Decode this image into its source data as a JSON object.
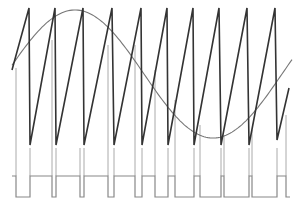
{
  "diagram": {
    "type": "pwm-modulation",
    "colors": {
      "background": "#ffffff",
      "sawtooth": "#333333",
      "sine": "#777777",
      "markers": "#aaaaaa",
      "pwm": "#888888"
    },
    "sawtooth": {
      "start": [
        12,
        70
      ],
      "peak_y": 8,
      "trough_y": 145,
      "teeth": [
        {
          "trough_x": 12,
          "peak_x": 29
        },
        {
          "trough_x": 30,
          "peak_x": 55
        },
        {
          "trough_x": 56,
          "peak_x": 83
        },
        {
          "trough_x": 84,
          "peak_x": 112
        },
        {
          "trough_x": 114,
          "peak_x": 141
        },
        {
          "trough_x": 142,
          "peak_x": 167
        },
        {
          "trough_x": 168,
          "peak_x": 193
        },
        {
          "trough_x": 194,
          "peak_x": 219
        },
        {
          "trough_x": 221,
          "peak_x": 247
        },
        {
          "trough_x": 249,
          "peak_x": 275
        }
      ],
      "end": {
        "trough_x": 277,
        "trough_y": 140,
        "peak_x": 289,
        "peak_y": 88
      }
    },
    "sine": {
      "x_start": 12,
      "x_end": 292,
      "center_y": 74,
      "amplitude": 64,
      "period": 276,
      "phase_note": "starts near center, peaks ~x=84, trough ~x=222"
    },
    "pwm": {
      "high_y": 176,
      "low_y": 197,
      "marker_bottom_y": 176,
      "transitions": [
        {
          "x": 16,
          "marker_top": 68
        },
        {
          "x": 30,
          "marker_top": 148
        },
        {
          "x": 52,
          "marker_top": 40
        },
        {
          "x": 56,
          "marker_top": 148
        },
        {
          "x": 80,
          "marker_top": 148
        },
        {
          "x": 84,
          "marker_top": 148
        },
        {
          "x": 108,
          "marker_top": 45
        },
        {
          "x": 114,
          "marker_top": 148
        },
        {
          "x": 135,
          "marker_top": 45
        },
        {
          "x": 142,
          "marker_top": 148
        },
        {
          "x": 155,
          "marker_top": 70
        },
        {
          "x": 168,
          "marker_top": 148
        },
        {
          "x": 175,
          "marker_top": 100
        },
        {
          "x": 194,
          "marker_top": 148
        },
        {
          "x": 200,
          "marker_top": 125
        },
        {
          "x": 221,
          "marker_top": 148
        },
        {
          "x": 224,
          "marker_top": 135
        },
        {
          "x": 249,
          "marker_top": 148
        },
        {
          "x": 252,
          "marker_top": 130
        },
        {
          "x": 277,
          "marker_top": 148
        },
        {
          "x": 286,
          "marker_top": 115
        }
      ],
      "levels": [
        {
          "from": 12,
          "to": 16,
          "level": "high"
        },
        {
          "from": 16,
          "to": 30,
          "level": "low"
        },
        {
          "from": 30,
          "to": 52,
          "level": "high"
        },
        {
          "from": 52,
          "to": 56,
          "level": "low"
        },
        {
          "from": 56,
          "to": 80,
          "level": "high"
        },
        {
          "from": 80,
          "to": 84,
          "level": "low"
        },
        {
          "from": 84,
          "to": 108,
          "level": "high"
        },
        {
          "from": 108,
          "to": 114,
          "level": "low"
        },
        {
          "from": 114,
          "to": 135,
          "level": "high"
        },
        {
          "from": 135,
          "to": 142,
          "level": "low"
        },
        {
          "from": 142,
          "to": 155,
          "level": "high"
        },
        {
          "from": 155,
          "to": 168,
          "level": "low"
        },
        {
          "from": 168,
          "to": 175,
          "level": "high"
        },
        {
          "from": 175,
          "to": 194,
          "level": "low"
        },
        {
          "from": 194,
          "to": 200,
          "level": "high"
        },
        {
          "from": 200,
          "to": 221,
          "level": "low"
        },
        {
          "from": 221,
          "to": 224,
          "level": "high"
        },
        {
          "from": 224,
          "to": 249,
          "level": "low"
        },
        {
          "from": 249,
          "to": 252,
          "level": "high"
        },
        {
          "from": 252,
          "to": 277,
          "level": "low"
        },
        {
          "from": 277,
          "to": 286,
          "level": "high"
        },
        {
          "from": 286,
          "to": 290,
          "level": "low"
        }
      ]
    }
  }
}
